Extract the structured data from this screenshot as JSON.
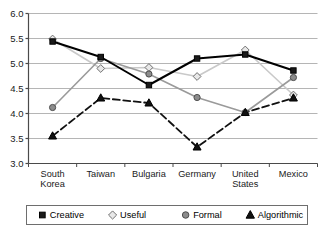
{
  "chart_data": {
    "type": "line",
    "title": "",
    "xlabel": "",
    "ylabel": "",
    "categories": [
      "South Korea",
      "Taiwan",
      "Bulgaria",
      "Germany",
      "United States",
      "Mexico"
    ],
    "category_lines": [
      [
        "South",
        "Korea"
      ],
      [
        "Taiwan"
      ],
      [
        "Bulgaria"
      ],
      [
        "Germany"
      ],
      [
        "United",
        "States"
      ],
      [
        "Mexico"
      ]
    ],
    "ylim": [
      3.0,
      6.0
    ],
    "yticks": [
      3.0,
      3.5,
      4.0,
      4.5,
      5.0,
      5.5,
      6.0
    ],
    "ytick_labels": [
      "3.0",
      "3.5",
      "4.0",
      "4.5",
      "5.0",
      "5.5",
      "6.0"
    ],
    "grid": true,
    "grid_axis": "y",
    "legend_position": "bottom",
    "series": [
      {
        "name": "Creative",
        "marker": "square",
        "marker_fill": "#1a1a1a",
        "marker_stroke": "#000000",
        "line_style": "solid",
        "line_color": "#000000",
        "line_width": 2.0,
        "values": [
          5.44,
          5.13,
          4.57,
          5.1,
          5.18,
          4.86
        ]
      },
      {
        "name": "Useful",
        "marker": "diamond",
        "marker_fill": "#e8e8e8",
        "marker_stroke": "#707070",
        "line_style": "solid",
        "line_color": "#c9c9c9",
        "line_width": 1.6,
        "values": [
          5.49,
          4.9,
          4.92,
          4.74,
          5.27,
          4.37
        ]
      },
      {
        "name": "Formal",
        "marker": "circle",
        "marker_fill": "#8c8c8c",
        "marker_stroke": "#4d4d4d",
        "line_style": "solid",
        "line_color": "#9a9a9a",
        "line_width": 1.6,
        "values": [
          4.12,
          5.1,
          4.79,
          4.32,
          4.02,
          4.72
        ]
      },
      {
        "name": "Algorithmic",
        "marker": "triangle",
        "marker_fill": "#111111",
        "marker_stroke": "#000000",
        "line_style": "dashed",
        "line_color": "#111111",
        "line_width": 1.8,
        "values": [
          3.55,
          4.31,
          4.21,
          3.33,
          4.02,
          4.31
        ]
      }
    ],
    "colors": {
      "axis": "#4a4a4a",
      "grid": "#b5b5b5",
      "background": "#ffffff",
      "legend_border": "#6e6e6e",
      "text": "#1a1a1a"
    }
  },
  "legend": {
    "items": [
      {
        "label": "Creative",
        "marker": "square"
      },
      {
        "label": "Useful",
        "marker": "diamond"
      },
      {
        "label": "Formal",
        "marker": "circle"
      },
      {
        "label": "Algorithmic",
        "marker": "triangle"
      }
    ]
  }
}
